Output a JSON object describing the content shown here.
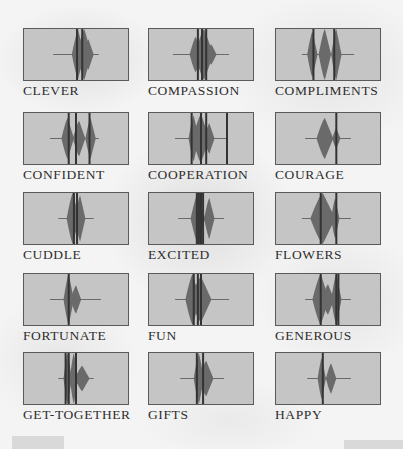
{
  "colors": {
    "box_fill": "#c5c5c5",
    "box_border": "#5a5a5a",
    "wave_fill": "#6a6a6a",
    "wave_dark": "#333333",
    "label": "#2e2e2e",
    "background": "#f4f4f4"
  },
  "grid": {
    "columns": [
      23,
      148,
      275
    ],
    "rows": [
      28,
      112,
      192,
      273,
      352
    ]
  },
  "words": [
    {
      "label": "CLEVER",
      "line": [
        0.28,
        0.72
      ],
      "lobes": [
        [
          0.52,
          0.06,
          0.48
        ],
        [
          0.58,
          0.07,
          0.5
        ],
        [
          0.62,
          0.05,
          0.3
        ]
      ],
      "bars": [
        0.51,
        0.56
      ]
    },
    {
      "label": "COMPASSION",
      "line": [
        0.23,
        0.77
      ],
      "lobes": [
        [
          0.45,
          0.06,
          0.35
        ],
        [
          0.53,
          0.09,
          0.5
        ],
        [
          0.6,
          0.05,
          0.2
        ]
      ],
      "bars": [
        0.47,
        0.51,
        0.55
      ]
    },
    {
      "label": "COMPLIMENTS",
      "line": [
        0.25,
        0.75
      ],
      "lobes": [
        [
          0.35,
          0.05,
          0.45
        ],
        [
          0.47,
          0.06,
          0.5
        ],
        [
          0.58,
          0.05,
          0.5
        ]
      ],
      "bars": [
        0.36,
        0.56
      ]
    },
    {
      "label": "CONFIDENT",
      "line": [
        0.25,
        0.72
      ],
      "lobes": [
        [
          0.42,
          0.06,
          0.4
        ],
        [
          0.53,
          0.06,
          0.35
        ],
        [
          0.64,
          0.05,
          0.4
        ]
      ],
      "bars": [
        0.43,
        0.5,
        0.63
      ]
    },
    {
      "label": "COOPERATION",
      "line": [
        0.25,
        0.75
      ],
      "lobes": [
        [
          0.43,
          0.05,
          0.45
        ],
        [
          0.5,
          0.08,
          0.48
        ],
        [
          0.58,
          0.05,
          0.3
        ]
      ],
      "bars": [
        0.41,
        0.5,
        0.55,
        0.75
      ]
    },
    {
      "label": "COURAGE",
      "line": [
        0.28,
        0.72
      ],
      "lobes": [
        [
          0.47,
          0.08,
          0.4
        ],
        [
          0.58,
          0.04,
          0.2
        ]
      ],
      "bars": [
        0.58
      ]
    },
    {
      "label": "CUDDLE",
      "line": [
        0.33,
        0.67
      ],
      "lobes": [
        [
          0.47,
          0.06,
          0.5
        ],
        [
          0.54,
          0.05,
          0.45
        ]
      ],
      "bars": [
        0.48,
        0.51
      ]
    },
    {
      "label": "EXCITED",
      "line": [
        0.28,
        0.72
      ],
      "lobes": [
        [
          0.47,
          0.07,
          0.5
        ],
        [
          0.58,
          0.05,
          0.4
        ]
      ],
      "bars": [
        0.46,
        0.48,
        0.5,
        0.52
      ]
    },
    {
      "label": "FLOWERS",
      "line": [
        0.25,
        0.72
      ],
      "lobes": [
        [
          0.45,
          0.12,
          0.5
        ],
        [
          0.57,
          0.04,
          0.4
        ]
      ],
      "bars": [
        0.43,
        0.58
      ]
    },
    {
      "label": "FORTUNATE",
      "line": [
        0.25,
        0.74
      ],
      "lobes": [
        [
          0.43,
          0.05,
          0.5
        ],
        [
          0.5,
          0.05,
          0.28
        ]
      ],
      "bars": [
        0.43
      ]
    },
    {
      "label": "FUN",
      "line": [
        0.25,
        0.77
      ],
      "lobes": [
        [
          0.42,
          0.07,
          0.5
        ],
        [
          0.5,
          0.1,
          0.45
        ]
      ],
      "bars": [
        0.43,
        0.47,
        0.5
      ]
    },
    {
      "label": "GENEROUS",
      "line": [
        0.28,
        0.72
      ],
      "lobes": [
        [
          0.43,
          0.08,
          0.5
        ],
        [
          0.5,
          0.06,
          0.3
        ],
        [
          0.58,
          0.05,
          0.5
        ]
      ],
      "bars": [
        0.43,
        0.58,
        0.6
      ]
    },
    {
      "label": "GET-TOGETHER",
      "line": [
        0.33,
        0.67
      ],
      "lobes": [
        [
          0.42,
          0.04,
          0.5
        ],
        [
          0.48,
          0.04,
          0.5
        ],
        [
          0.56,
          0.07,
          0.25
        ]
      ],
      "bars": [
        0.4,
        0.43,
        0.5
      ]
    },
    {
      "label": "GIFTS",
      "line": [
        0.3,
        0.72
      ],
      "lobes": [
        [
          0.48,
          0.05,
          0.5
        ],
        [
          0.55,
          0.07,
          0.35
        ]
      ],
      "bars": [
        0.46,
        0.52
      ]
    },
    {
      "label": "HAPPY",
      "line": [
        0.3,
        0.72
      ],
      "lobes": [
        [
          0.44,
          0.04,
          0.4
        ],
        [
          0.53,
          0.05,
          0.3
        ]
      ],
      "bars": [
        0.45
      ]
    }
  ]
}
